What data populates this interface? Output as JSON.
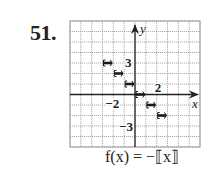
{
  "problem": {
    "number": "51."
  },
  "formula": {
    "lhs": "f(x)",
    "eq": "=",
    "rhs": "−⟦x⟧"
  },
  "colors": {
    "grid": "#9a9a9a",
    "axis": "#222222",
    "step": "#1a1a1a",
    "background": "#ffffff"
  },
  "chart_data": {
    "type": "line",
    "title": "f(x) = −⟦x⟧",
    "xlabel": "x",
    "ylabel": "y",
    "xlim": [
      -6,
      6
    ],
    "ylim": [
      -5,
      7
    ],
    "grid": true,
    "tick_labels": [
      {
        "axis": "y",
        "value": 3,
        "label": "3"
      },
      {
        "axis": "x",
        "value": 2,
        "label": "2"
      },
      {
        "axis": "x",
        "value": -2,
        "label": "−2"
      },
      {
        "axis": "y",
        "value": -3,
        "label": "−3"
      }
    ],
    "series": [
      {
        "name": "f(x) = −⟦x⟧",
        "style": "step",
        "segments": [
          {
            "x_start": -3,
            "x_end": -2,
            "y": 3
          },
          {
            "x_start": -2,
            "x_end": -1,
            "y": 2
          },
          {
            "x_start": -1,
            "x_end": 0,
            "y": 1
          },
          {
            "x_start": 0,
            "x_end": 1,
            "y": 0
          },
          {
            "x_start": 1,
            "x_end": 2,
            "y": -1
          },
          {
            "x_start": 2,
            "x_end": 3,
            "y": -2
          }
        ]
      }
    ]
  }
}
